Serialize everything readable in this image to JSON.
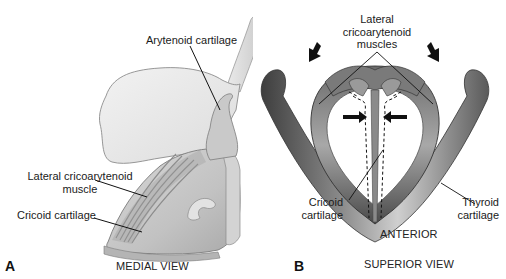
{
  "figure": {
    "panel_a": {
      "letter": "A",
      "caption": "MEDIAL VIEW",
      "labels": {
        "arytenoid": "Arytenoid cartilage",
        "lca_line1": "Lateral cricoarytenoid",
        "lca_line2": "muscle",
        "cricoid": "Cricoid cartilage"
      }
    },
    "panel_b": {
      "letter": "B",
      "caption": "SUPERIOR VIEW",
      "orientation": "ANTERIOR",
      "labels": {
        "lca_line1": "Lateral",
        "lca_line2": "cricoarytenoid",
        "lca_line3": "muscles",
        "cricoid_line1": "Cricoid",
        "cricoid_line2": "cartilage",
        "thyroid_line1": "Thyroid",
        "thyroid_line2": "cartilage"
      }
    },
    "colors": {
      "background": "#ffffff",
      "cartilage_light": "#e6e6e6",
      "cartilage_mid": "#bdbdbd",
      "cartilage_dark": "#5a5a5a",
      "leader_line": "#111111"
    }
  }
}
